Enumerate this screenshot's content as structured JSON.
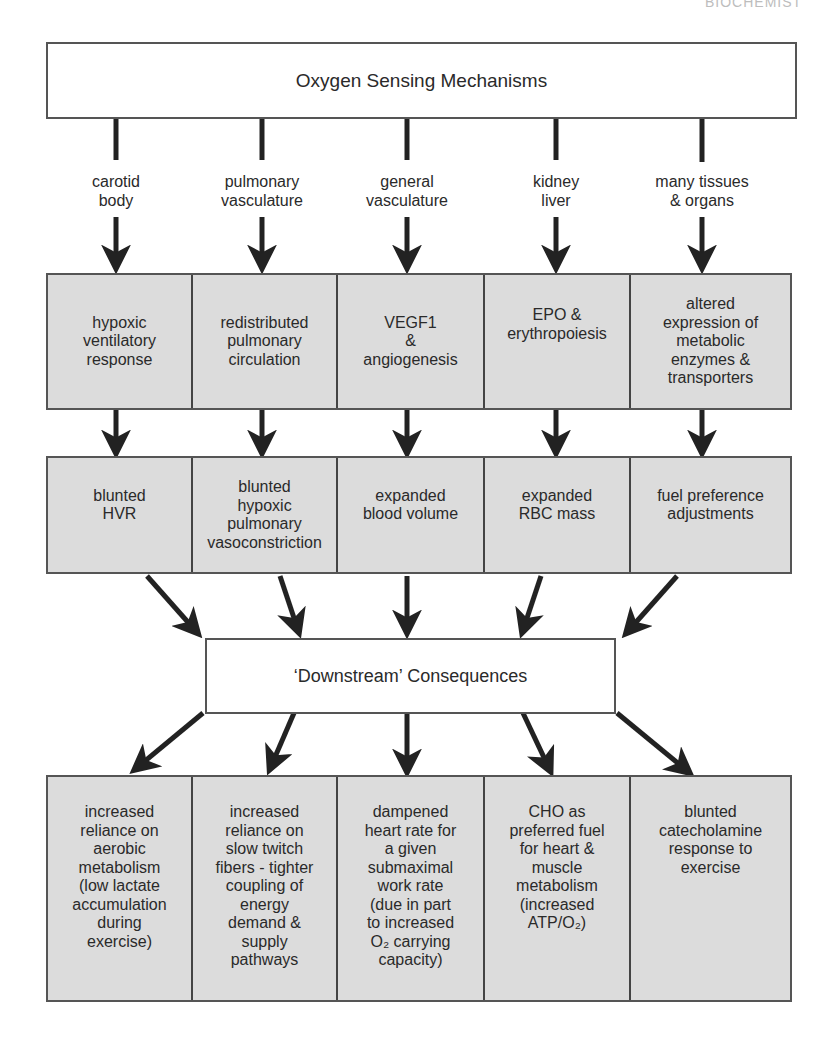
{
  "page_header": "BIOCHEMIST",
  "top_box": {
    "title": "Oxygen Sensing Mechanisms"
  },
  "sensor_sites": [
    {
      "line1": "carotid",
      "line2": "body"
    },
    {
      "line1": "pulmonary",
      "line2": "vasculature"
    },
    {
      "line1": "general",
      "line2": "vasculature"
    },
    {
      "line1": "kidney",
      "line2": "liver"
    },
    {
      "line1": "many tissues",
      "line2": "& organs"
    }
  ],
  "responses": [
    "hypoxic\nventilatory\nresponse",
    "redistributed\npulmonary\ncirculation",
    "VEGF1\n&\nangiogenesis",
    "EPO &\nerythropoiesis",
    "altered\nexpression of\nmetabolic\nenzymes &\ntransporters"
  ],
  "adaptations": [
    "blunted\nHVR",
    "blunted\nhypoxic\npulmonary\nvasoconstriction",
    "expanded\nblood volume",
    "expanded\nRBC mass",
    "fuel preference\nadjustments"
  ],
  "downstream_box": {
    "title": "‘Downstream’ Consequences"
  },
  "consequences": [
    "increased\nreliance on\naerobic\nmetabolism\n(low lactate\naccumulation\nduring\nexercise)",
    "increased\nreliance on\nslow twitch\nfibers - tighter\ncoupling of\nenergy\ndemand &\nsupply\npathways",
    "dampened\nheart rate for\na given\nsubmaximal\nwork rate\n(due in part\nto increased\nO₂ carrying\ncapacity)",
    "CHO as\npreferred fuel\nfor heart &\nmuscle\nmetabolism\n(increased\nATP/O₂)",
    "blunted\ncatecholamine\nresponse to\nexercise"
  ],
  "colors": {
    "box_fill": "#dcdcdc",
    "border": "#555555",
    "arrow": "#222222",
    "text": "#2a2a2a"
  }
}
